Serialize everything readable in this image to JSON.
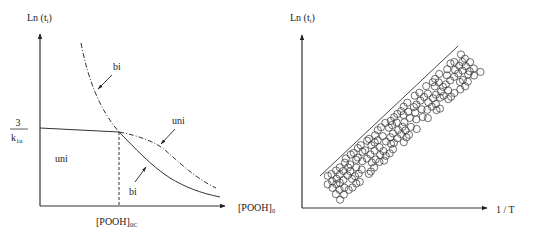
{
  "chart_data": [
    {
      "type": "line",
      "title": "",
      "ylabel": "Ln (t_i)",
      "ylabel_main": "Ln (t",
      "ylabel_sub": "i",
      "ylabel_close": ")",
      "xlabel": "[POOH]_0",
      "xlabel_main": "[POOH]",
      "xlabel_sub": "0",
      "x_tick_label_main": "[POOH]",
      "x_tick_label_sub": "0C",
      "y_tick_label_num": "3",
      "y_tick_label_den_main": "k",
      "y_tick_label_den_sub": "1u",
      "grid": false,
      "series": [
        {
          "name": "uni (solid, plateau)",
          "style": "solid",
          "description": "horizontal at 3/k1u until [POOH]0C"
        },
        {
          "name": "bi (dash-dot)",
          "style": "dash-dot",
          "description": "steeply decreasing, crosses plateau at [POOH]0C"
        },
        {
          "name": "uni (dash-dot continuation)",
          "style": "dash-dot",
          "description": "gently decreasing beyond [POOH]0C"
        },
        {
          "name": "bi (solid)",
          "style": "solid",
          "description": "decreasing beyond [POOH]0C"
        }
      ],
      "annotations": [
        {
          "text": "bi",
          "target": "dash-dot steep curve"
        },
        {
          "text": "uni",
          "target": "dash-dot curve beyond critical point"
        },
        {
          "text": "bi",
          "target": "solid curve beyond critical point"
        },
        {
          "text": "uni",
          "target": "region below plateau"
        }
      ]
    },
    {
      "type": "scatter",
      "title": "",
      "ylabel": "Ln (t_i)",
      "ylabel_main": "Ln (t",
      "ylabel_sub": "i",
      "ylabel_close": ")",
      "xlabel": "1 / T",
      "grid": false,
      "description": "band of open circles along an increasing straight line (upper bound)"
    }
  ],
  "labels": {
    "bi_top": "bi",
    "uni_right": "uni",
    "bi_bottom": "bi",
    "uni_region": "uni"
  }
}
